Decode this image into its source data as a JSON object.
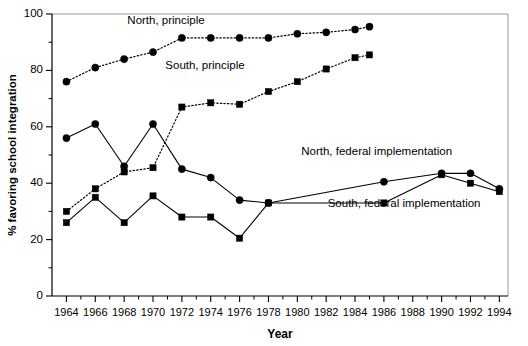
{
  "chart_data": {
    "type": "line",
    "title": "",
    "xlabel": "Year",
    "ylabel": "% favoring school integration",
    "xlim": [
      1963,
      1994.6
    ],
    "ylim": [
      0,
      100
    ],
    "xticks": [
      1964,
      1966,
      1968,
      1970,
      1972,
      1974,
      1976,
      1978,
      1980,
      1982,
      1984,
      1986,
      1988,
      1990,
      1992,
      1994
    ],
    "xtick_labels": [
      "1964",
      "1966",
      "1968",
      "1970",
      "1972",
      "1974",
      "1976",
      "1978",
      "1980",
      "1982",
      "1984",
      "1986",
      "1988",
      "1990",
      "1992",
      "1994"
    ],
    "yticks": [
      0,
      20,
      40,
      60,
      80,
      100
    ],
    "ytick_labels": [
      "0",
      "20",
      "40",
      "60",
      "80",
      "100"
    ],
    "yticks_minor": [
      10,
      30,
      50,
      70,
      90
    ],
    "grid": false,
    "legend_position": "inline-annotations",
    "series": [
      {
        "name": "North, principle",
        "marker": "circle",
        "linestyle": "dotted",
        "x": [
          1964,
          1966,
          1968,
          1970,
          1972,
          1974,
          1976,
          1978,
          1980,
          1982,
          1984,
          1985
        ],
        "values": [
          76,
          81,
          84,
          86.5,
          91.5,
          91.5,
          91.5,
          91.5,
          93,
          93.5,
          94.5,
          95.5
        ]
      },
      {
        "name": "South, principle",
        "marker": "square",
        "linestyle": "dotted",
        "x": [
          1964,
          1966,
          1968,
          1970,
          1972,
          1974,
          1976,
          1978,
          1980,
          1982,
          1984,
          1985
        ],
        "values": [
          30,
          38,
          44,
          45.5,
          67,
          68.5,
          68,
          72.5,
          76,
          80.5,
          84.5,
          85.5
        ]
      },
      {
        "name": "North, federal implementation",
        "marker": "circle",
        "linestyle": "solid",
        "x": [
          1964,
          1966,
          1968,
          1970,
          1972,
          1974,
          1976,
          1978,
          1986,
          1990,
          1992,
          1994
        ],
        "values": [
          56,
          61,
          46,
          61,
          45,
          42,
          34,
          33,
          40.5,
          43.5,
          43.5,
          38
        ]
      },
      {
        "name": "South, federal implementation",
        "marker": "square",
        "linestyle": "solid",
        "x": [
          1964,
          1966,
          1968,
          1970,
          1972,
          1974,
          1976,
          1978,
          1986,
          1990,
          1992,
          1994
        ],
        "values": [
          26,
          35,
          26,
          35.5,
          28,
          28,
          20.5,
          33,
          33,
          43,
          40,
          37
        ]
      }
    ],
    "annotations": [
      {
        "text": "North, principle",
        "x": 1970.9,
        "y": 96.5
      },
      {
        "text": "South, principle",
        "x": 1973.6,
        "y": 80.5
      },
      {
        "text": "North, federal implementation",
        "x": 1985.5,
        "y": 50
      },
      {
        "text": "South, federal implementation",
        "x": 1987.4,
        "y": 31.5
      }
    ]
  },
  "colors": {
    "axis": "#000000",
    "series": "#000000",
    "background": "#ffffff"
  }
}
